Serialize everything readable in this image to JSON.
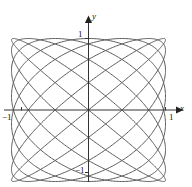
{
  "figure": {
    "name": "lissajous-curve-plot",
    "background_color": "#ffffff"
  },
  "axes": {
    "x_axis_label": "x",
    "y_axis_label": "y",
    "axis_color": "#333333",
    "origin_px": {
      "x": 88,
      "y": 110
    }
  },
  "ticks": {
    "y_top": "1",
    "y_bottom": "−1",
    "x_right": "1",
    "x_left": "−1"
  },
  "chart_data": {
    "type": "line",
    "title": "",
    "xlabel": "x",
    "ylabel": "y",
    "xlim": [
      -1.25,
      1.25
    ],
    "ylim": [
      -1.25,
      1.25
    ],
    "xticks": [
      -1,
      1
    ],
    "yticks": [
      -1,
      1
    ],
    "xtick_labels": [
      "−1",
      "1"
    ],
    "ytick_labels": [
      "−1",
      "1"
    ],
    "grid": false,
    "legend": null,
    "curve_color": "#5a5a5a",
    "curve_width": 1,
    "parametric": {
      "description": "Lissajous figure filling the square from -1 to 1 on both axes",
      "x_expression": "sin(8t)",
      "y_expression": "sin(7t)",
      "freq_x": 8,
      "freq_y": 7,
      "phase": 0,
      "t_start": 0,
      "t_end": 6.283185307179586,
      "samples": 2400,
      "top_tangent_lobes": 8,
      "side_tangent_lobes": 7
    }
  }
}
